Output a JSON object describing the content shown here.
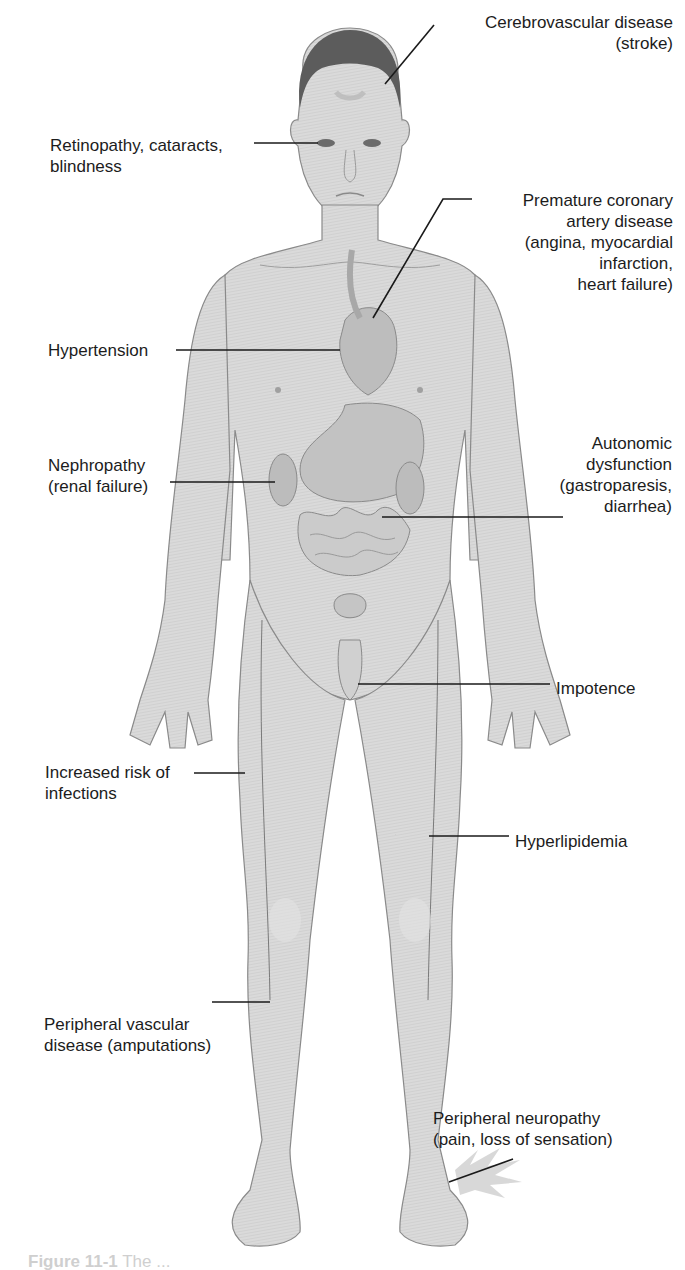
{
  "figure": {
    "colors": {
      "background": "#ffffff",
      "skin": "#d9d9d9",
      "skin_shadow": "#b9b9b9",
      "outline": "#8a8a8a",
      "organ": "#bdbdbd",
      "hair": "#5a5a5a",
      "leader_line": "#1a1a1a",
      "text": "#1c1c1c",
      "caption": "#cfcfcf"
    }
  },
  "labels": [
    {
      "id": "cerebrovascular",
      "text": "Cerebrovascular disease\n(stroke)",
      "align": "right",
      "box": {
        "left": 433,
        "top": 12,
        "width": 240
      },
      "line": [
        [
          434,
          25
        ],
        [
          385,
          84
        ]
      ]
    },
    {
      "id": "retinopathy",
      "text": "Retinopathy, cataracts,\nblindness",
      "align": "left",
      "box": {
        "left": 50,
        "top": 135,
        "width": 220
      },
      "line": [
        [
          254,
          143
        ],
        [
          318,
          143
        ]
      ]
    },
    {
      "id": "coronary",
      "text": "Premature coronary\nartery disease\n(angina, myocardial\ninfarction,\nheart failure)",
      "align": "right",
      "box": {
        "left": 470,
        "top": 190,
        "width": 203
      },
      "line": [
        [
          472,
          199
        ],
        [
          443,
          199
        ],
        [
          373,
          318
        ]
      ]
    },
    {
      "id": "hypertension",
      "text": "Hypertension",
      "align": "left",
      "box": {
        "left": 48,
        "top": 340,
        "width": 130
      },
      "line": [
        [
          176,
          350
        ],
        [
          340,
          350
        ]
      ]
    },
    {
      "id": "nephropathy",
      "text": "Nephropathy\n(renal failure)",
      "align": "left",
      "box": {
        "left": 48,
        "top": 455,
        "width": 130
      },
      "line": [
        [
          170,
          482
        ],
        [
          275,
          482
        ]
      ]
    },
    {
      "id": "autonomic",
      "text": "Autonomic\ndysfunction\n(gastroparesis,\ndiarrhea)",
      "align": "right",
      "box": {
        "left": 520,
        "top": 433,
        "width": 152
      },
      "line": [
        [
          563,
          517
        ],
        [
          382,
          517
        ]
      ]
    },
    {
      "id": "impotence",
      "text": "Impotence",
      "align": "left",
      "box": {
        "left": 556,
        "top": 678,
        "width": 100
      },
      "line": [
        [
          550,
          684
        ],
        [
          358,
          684
        ]
      ]
    },
    {
      "id": "infections",
      "text": "Increased risk of\ninfections",
      "align": "left",
      "box": {
        "left": 45,
        "top": 762,
        "width": 160
      },
      "line": [
        [
          194,
          773
        ],
        [
          245,
          773
        ]
      ]
    },
    {
      "id": "hyperlipidemia",
      "text": "Hyperlipidemia",
      "align": "left",
      "box": {
        "left": 515,
        "top": 831,
        "width": 140
      },
      "line": [
        [
          509,
          836
        ],
        [
          429,
          836
        ]
      ]
    },
    {
      "id": "pvd",
      "text": "Peripheral vascular\ndisease (amputations)",
      "align": "left",
      "box": {
        "left": 44,
        "top": 1014,
        "width": 240
      },
      "line": [
        [
          212,
          1002
        ],
        [
          270,
          1002
        ]
      ]
    },
    {
      "id": "neuropathy",
      "text": "Peripheral neuropathy\n(pain, loss of sensation)",
      "align": "left",
      "box": {
        "left": 433,
        "top": 1108,
        "width": 240
      },
      "line": [
        [
          513,
          1159
        ],
        [
          449,
          1182
        ]
      ]
    }
  ],
  "caption": {
    "lead": "Figure 11-1",
    "rest": "  The ...",
    "note": "Caption text is faded and truncated at the bottom edge of the image."
  }
}
